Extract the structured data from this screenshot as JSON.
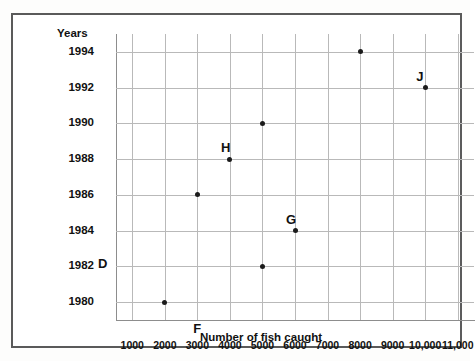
{
  "chart_data": {
    "type": "scatter",
    "title": "",
    "xlabel": "Number of fish caught",
    "ylabel": "Years",
    "xlim": [
      500,
      11500
    ],
    "ylim": [
      1979,
      1995
    ],
    "grid": true,
    "legend": "none",
    "x_tick_labels": [
      "1000",
      "2000",
      "3000",
      "4000",
      "5000",
      "6000",
      "7000",
      "8000",
      "9000",
      "10,000",
      "11,000"
    ],
    "x_tick_values": [
      1000,
      2000,
      3000,
      4000,
      5000,
      6000,
      7000,
      8000,
      9000,
      10000,
      11000
    ],
    "y_tick_labels": [
      "1994",
      "1992",
      "1990",
      "1988",
      "1986",
      "1984",
      "1982",
      "1980"
    ],
    "y_tick_values": [
      1994,
      1992,
      1990,
      1988,
      1986,
      1984,
      1982,
      1980
    ],
    "points": [
      {
        "x": 8000,
        "y": 1994,
        "label": ""
      },
      {
        "x": 10000,
        "y": 1992,
        "label": "J"
      },
      {
        "x": 5000,
        "y": 1990,
        "label": ""
      },
      {
        "x": 4000,
        "y": 1988,
        "label": "H"
      },
      {
        "x": 3000,
        "y": 1986,
        "label": ""
      },
      {
        "x": 6000,
        "y": 1984,
        "label": "G"
      },
      {
        "x": 5000,
        "y": 1982,
        "label": ""
      },
      {
        "x": 2000,
        "y": 1980,
        "label": ""
      }
    ],
    "annotations": [
      {
        "text": "D",
        "x": 500,
        "y": 1982,
        "placement": "left-of-axis-at-1982"
      },
      {
        "text": "F",
        "x": 3000,
        "y": 1979,
        "placement": "below-axis-at-3000"
      }
    ],
    "point_color": "#1b1b1b",
    "grid_color": "#b9b9b9",
    "axis_color": "#8d8d8d",
    "frame_color": "#5a5a5a"
  }
}
